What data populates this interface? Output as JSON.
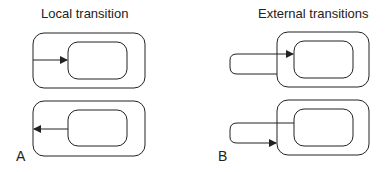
{
  "panel_a": {
    "title": "Local transition",
    "label": "A"
  },
  "panel_b": {
    "title": "External transitions",
    "label": "B"
  },
  "colors": {
    "stroke": "#222222",
    "background": "#ffffff"
  }
}
